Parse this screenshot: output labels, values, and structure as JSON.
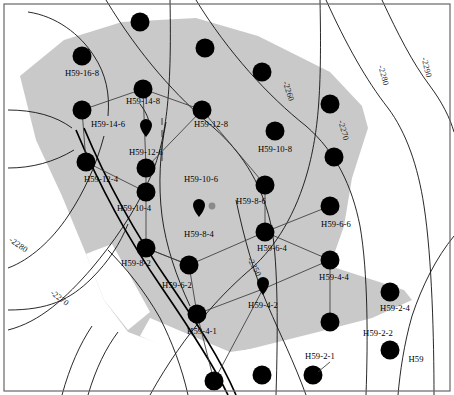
{
  "figure": {
    "width": 454,
    "height": 395,
    "background_color": "#ffffff",
    "polygon_fill_color": "#c9c9c9",
    "well_marker_color": "#000000",
    "contour_line_color": "#111111",
    "frame_color": "#666666"
  },
  "contours": {
    "unit_note": "",
    "labels": [
      {
        "id": "c2250",
        "text": "-2250",
        "x": 252,
        "y": 268,
        "rotation": 62
      },
      {
        "id": "c2260",
        "text": "-2260",
        "x": 286,
        "y": 92,
        "rotation": 72
      },
      {
        "id": "c2270-top",
        "text": "-2270",
        "x": 341,
        "y": 131,
        "rotation": 74
      },
      {
        "id": "c2280-top",
        "text": "-2280",
        "x": 381,
        "y": 76,
        "rotation": 74
      },
      {
        "id": "c2290-top",
        "text": "-2290",
        "x": 424,
        "y": 68,
        "rotation": 76
      },
      {
        "id": "c2280-left",
        "text": "-2280",
        "x": 17,
        "y": 247,
        "rotation": 35
      },
      {
        "id": "c2270-left",
        "text": "-2270",
        "x": 58,
        "y": 300,
        "rotation": 38
      }
    ]
  },
  "wells": [
    {
      "id": "w-16-8",
      "label": "H59-16-8",
      "cx": 82,
      "cy": 56,
      "r": 9.5,
      "type": "circle",
      "label_x": 82,
      "label_y": 76
    },
    {
      "id": "w-14-8",
      "label": "H59-14-8",
      "cx": 143,
      "cy": 89,
      "r": 9.5,
      "type": "circle",
      "label_x": 143,
      "label_y": 104
    },
    {
      "id": "w-14-6",
      "label": "H59-14-6",
      "cx": 82,
      "cy": 110,
      "r": 9.5,
      "type": "circle",
      "label_x": 108,
      "label_y": 127
    },
    {
      "id": "w-12-8",
      "label": "H59-12-8",
      "cx": 202,
      "cy": 110,
      "r": 9.5,
      "type": "circle",
      "label_x": 211,
      "label_y": 127
    },
    {
      "id": "w-12-6",
      "label": "H59-12-6",
      "cx": 146,
      "cy": 132,
      "r": 6.0,
      "type": "pin",
      "label_x": 146,
      "label_y": 155
    },
    {
      "id": "w-12-4",
      "label": "H59-12-4",
      "cx": 86,
      "cy": 162,
      "r": 9.5,
      "type": "circle",
      "label_x": 101,
      "label_y": 182
    },
    {
      "id": "w-10-8",
      "label": "H59-10-8",
      "cx": 275,
      "cy": 131,
      "r": 9.5,
      "type": "circle",
      "label_x": 275,
      "label_y": 152
    },
    {
      "id": "w-10-6",
      "label": "H59-10-6",
      "cx": 146,
      "cy": 168,
      "r": 9.5,
      "type": "circle",
      "label_x": 201,
      "label_y": 182
    },
    {
      "id": "w-10-4",
      "label": "H59-10-4",
      "cx": 146,
      "cy": 192,
      "r": 9.5,
      "type": "circle",
      "label_x": 134,
      "label_y": 211
    },
    {
      "id": "w-8-6",
      "label": "H59-8-6",
      "cx": 265,
      "cy": 185,
      "r": 9.5,
      "type": "circle",
      "label_x": 251,
      "label_y": 204
    },
    {
      "id": "w-8-4",
      "label": "H59-8-4",
      "cx": 199,
      "cy": 211,
      "r": 6.0,
      "type": "pin",
      "label_x": 199,
      "label_y": 237
    },
    {
      "id": "w-8-2",
      "label": "H59-8-2",
      "cx": 146,
      "cy": 248,
      "r": 9.5,
      "type": "circle",
      "label_x": 136,
      "label_y": 266
    },
    {
      "id": "w-6-6",
      "label": "H59-6-6",
      "cx": 330,
      "cy": 206,
      "r": 9.5,
      "type": "circle",
      "label_x": 336,
      "label_y": 227
    },
    {
      "id": "w-6-4",
      "label": "H59-6-4",
      "cx": 265,
      "cy": 232,
      "r": 9.5,
      "type": "circle",
      "label_x": 272,
      "label_y": 251
    },
    {
      "id": "w-6-2",
      "label": "H59-6-2",
      "cx": 189,
      "cy": 265,
      "r": 9.5,
      "type": "circle",
      "label_x": 177,
      "label_y": 288
    },
    {
      "id": "w-4-4",
      "label": "H59-4-4",
      "cx": 330,
      "cy": 260,
      "r": 9.5,
      "type": "circle",
      "label_x": 334,
      "label_y": 280
    },
    {
      "id": "w-4-2",
      "label": "H59-4-2",
      "cx": 263,
      "cy": 289,
      "r": 6.0,
      "type": "pin",
      "label_x": 263,
      "label_y": 308
    },
    {
      "id": "w-4-1",
      "label": "H59-4-1",
      "cx": 197,
      "cy": 314,
      "r": 9.5,
      "type": "circle",
      "label_x": 202,
      "label_y": 334
    },
    {
      "id": "w-2-4",
      "label": "H59-2-4",
      "cx": 390,
      "cy": 292,
      "r": 9.5,
      "type": "circle",
      "label_x": 395,
      "label_y": 311
    },
    {
      "id": "w-2-2",
      "label": "H59-2-2",
      "cx": 390,
      "cy": 350,
      "r": 9.5,
      "type": "circle",
      "label_x": 378,
      "label_y": 336
    },
    {
      "id": "w-2-1",
      "label": "H59-2-1",
      "cx": 313,
      "cy": 375,
      "r": 9.5,
      "type": "circle",
      "label_x": 320,
      "label_y": 359
    },
    {
      "id": "w-edge-1",
      "label": "",
      "cx": 140,
      "cy": 22,
      "r": 9.5,
      "type": "circle",
      "label_x": 0,
      "label_y": 0
    },
    {
      "id": "w-edge-2",
      "label": "",
      "cx": 205,
      "cy": 48,
      "r": 9.5,
      "type": "circle",
      "label_x": 0,
      "label_y": 0
    },
    {
      "id": "w-edge-3",
      "label": "",
      "cx": 262,
      "cy": 72,
      "r": 9.5,
      "type": "circle",
      "label_x": 0,
      "label_y": 0
    },
    {
      "id": "w-edge-4",
      "label": "",
      "cx": 330,
      "cy": 104,
      "r": 9.5,
      "type": "circle",
      "label_x": 0,
      "label_y": 0
    },
    {
      "id": "w-edge-5",
      "label": "",
      "cx": 334,
      "cy": 157,
      "r": 9.5,
      "type": "circle",
      "label_x": 0,
      "label_y": 0
    },
    {
      "id": "w-edge-6",
      "label": "",
      "cx": 330,
      "cy": 322,
      "r": 9.5,
      "type": "circle",
      "label_x": 0,
      "label_y": 0
    },
    {
      "id": "w-edge-7",
      "label": "",
      "cx": 262,
      "cy": 375,
      "r": 9.5,
      "type": "circle",
      "label_x": 0,
      "label_y": 0
    },
    {
      "id": "w-edge-8",
      "label": "",
      "cx": 214,
      "cy": 381,
      "r": 9.5,
      "type": "circle",
      "label_x": 0,
      "label_y": 0
    }
  ],
  "aux_markers": [
    {
      "id": "aux-8-4",
      "cx": 212,
      "cy": 206,
      "r": 3.4
    }
  ],
  "extra_labels": [
    {
      "id": "lbl-h59",
      "text": "H59",
      "x": 416,
      "y": 362
    }
  ]
}
